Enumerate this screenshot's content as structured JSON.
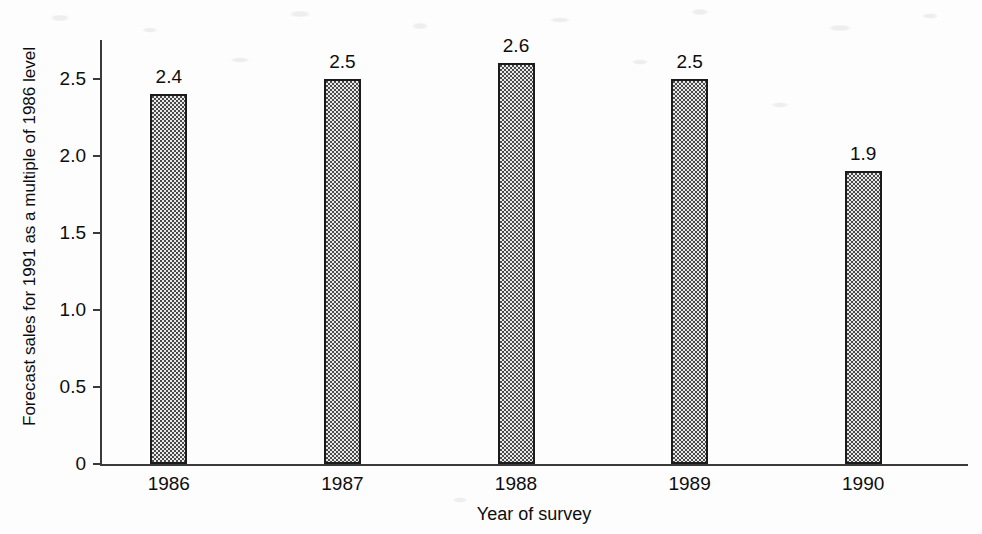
{
  "chart_data": {
    "type": "bar",
    "title": "",
    "subtitle": "",
    "xlabel": "Year of survey",
    "ylabel": "Forecast sales for 1991 as a multiple of 1986 level",
    "categories": [
      "1986",
      "1987",
      "1988",
      "1989",
      "1990"
    ],
    "values": [
      2.4,
      2.5,
      2.6,
      2.5,
      1.9
    ],
    "data_labels": [
      "2.4",
      "2.5",
      "2.6",
      "2.5",
      "1.9"
    ],
    "ylim": [
      0,
      2.75
    ],
    "yticks": [
      0,
      0.5,
      1.0,
      1.5,
      2.0,
      2.5
    ],
    "ytick_labels": [
      "0",
      "0.5",
      "1.0",
      "1.5",
      "2.0",
      "2.5"
    ],
    "grid": false,
    "legend": null,
    "legend_position": "none",
    "bar_fill": "#e9e9e9",
    "bar_border": "#1b1b1b",
    "axis_color": "#3a3a3a"
  }
}
